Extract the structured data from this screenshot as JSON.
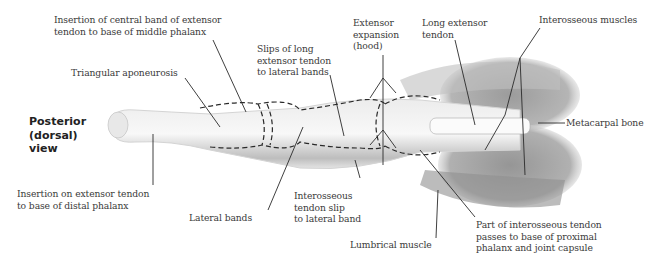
{
  "view_title": "Posterior\n(dorsal)\nview",
  "labels": {
    "central_band": "Insertion of central band of extensor\ntendon to base of middle phalanx",
    "triangular": "Triangular aponeurosis",
    "slips": "Slips of long\nextensor tendon\nto lateral bands",
    "extensor_expansion": "Extensor\nexpansion\n(hood)",
    "long_extensor": "Long extensor\ntendon",
    "interosseous_muscles": "Interosseous muscles",
    "metacarpal": "Metacarpal bone",
    "distal_insertion": "Insertion on extensor tendon\nto base of distal phalanx",
    "lateral_bands": "Lateral bands",
    "interosseous_slip": "Interosseous\ntendon slip\nto lateral band",
    "lumbrical": "Lumbrical muscle",
    "interosseous_part": "Part of interosseous tendon\npasses to base of proximal\nphalanx and joint capsule"
  },
  "colors": {
    "line": "#2a2a2a",
    "shade_dark": "#6e6e6e",
    "shade_light": "#cfcfcf"
  }
}
